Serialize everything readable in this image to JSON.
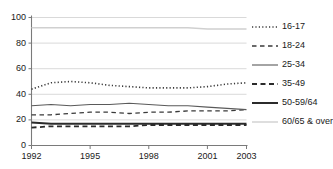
{
  "figure": {
    "top_remnant_text": "",
    "background_color": "#ffffff",
    "axis_color": "#7a7a7a",
    "grid_color": "#cfcfcf",
    "text_color": "#1a1a1a"
  },
  "legend": {
    "position": "right",
    "entries": [
      {
        "label": "16-17",
        "style": "dotted",
        "color": "#3a3a3a",
        "width": 1.6
      },
      {
        "label": "18-24",
        "style": "dashed",
        "color": "#3a3a3a",
        "width": 1.3
      },
      {
        "label": "25-34",
        "style": "solid",
        "color": "#5a5a5a",
        "width": 1.1
      },
      {
        "label": "35-49",
        "style": "dashed-bold",
        "color": "#2b2b2b",
        "width": 1.8
      },
      {
        "label": "50-59/64",
        "style": "solid-bold",
        "color": "#2b2b2b",
        "width": 2.0
      },
      {
        "label": "60/65 & over",
        "style": "solid-light",
        "color": "#d0d0d0",
        "width": 1.4
      }
    ]
  },
  "chart_data": {
    "type": "line",
    "title": "",
    "subtitle": "",
    "xlabel": "",
    "ylabel": "",
    "xlim": [
      1992,
      2003
    ],
    "ylim": [
      0,
      100
    ],
    "grid": true,
    "grid_axis": "y",
    "legend_position": "right",
    "x": [
      1992,
      1993,
      1994,
      1995,
      1996,
      1997,
      1998,
      1999,
      2000,
      2001,
      2002,
      2003
    ],
    "xticks": [
      1992,
      1995,
      1998,
      2001,
      2003
    ],
    "xtick_labels": [
      "1992",
      "1995",
      "1998",
      "2001",
      "2003"
    ],
    "yticks": [
      0,
      20,
      40,
      60,
      80,
      100
    ],
    "ytick_labels": [
      "0",
      "20",
      "40",
      "60",
      "80",
      "100"
    ],
    "series": [
      {
        "name": "16-17",
        "style": "dotted",
        "color": "#3a3a3a",
        "values": [
          44,
          49,
          50,
          49,
          47,
          46,
          45,
          45,
          45,
          46,
          48,
          49
        ]
      },
      {
        "name": "18-24",
        "style": "dashed",
        "color": "#3a3a3a",
        "values": [
          24,
          24,
          25,
          26,
          26,
          25,
          26,
          26,
          27,
          27,
          27,
          28
        ]
      },
      {
        "name": "25-34",
        "style": "solid",
        "color": "#5a5a5a",
        "values": [
          31,
          32,
          31,
          32,
          32,
          33,
          32,
          31,
          31,
          30,
          29,
          28
        ]
      },
      {
        "name": "35-49",
        "style": "dashed-bold",
        "color": "#2b2b2b",
        "values": [
          14,
          15,
          15,
          15,
          15,
          15,
          16,
          16,
          16,
          16,
          16,
          16
        ]
      },
      {
        "name": "50-59/64",
        "style": "solid-bold",
        "color": "#2b2b2b",
        "values": [
          18,
          17,
          17,
          17,
          17,
          17,
          17,
          17,
          17,
          17,
          17,
          17
        ]
      },
      {
        "name": "60/65 & over",
        "style": "solid-light",
        "color": "#d0d0d0",
        "values": [
          92,
          92,
          92,
          92,
          92,
          92,
          92,
          92,
          92,
          91,
          91,
          91
        ]
      }
    ]
  }
}
